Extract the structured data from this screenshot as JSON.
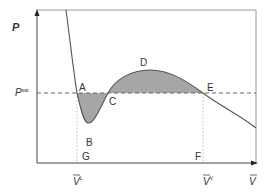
{
  "diagram": {
    "y_axis_label": "P",
    "x_axis_label": "V",
    "x_axis_label_bar": true,
    "psat_label": "P",
    "psat_superscript": "sat",
    "vl_label": "V",
    "vl_superscript": "L",
    "vv_label": "V",
    "vv_superscript": "V",
    "points": {
      "A": "A",
      "B": "B",
      "C": "C",
      "D": "D",
      "E": "E",
      "F": "F",
      "G": "G"
    },
    "colors": {
      "curve": "#555555",
      "shade": "#a6a6a6",
      "axis": "#444444",
      "dash": "#666666",
      "text": "#333333"
    }
  }
}
